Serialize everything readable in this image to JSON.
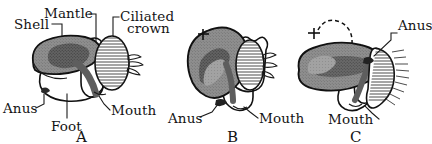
{
  "figure": {
    "background_color": "#ffffff",
    "ink_color": "#111111",
    "shell_fill": "#8e8e8e",
    "shell_dark_fill": "#4f4f4f",
    "visceral_fill": "#a8a8a8",
    "body_fill": "#ffffff"
  },
  "panels": [
    {
      "id": "A",
      "letter": "A",
      "labels": [
        {
          "key": "shell",
          "text": "Shell"
        },
        {
          "key": "mantle",
          "text": "Mantle"
        },
        {
          "key": "ciliated_crown",
          "text": "Ciliated"
        },
        {
          "key": "ciliated_crown2",
          "text": "crown"
        },
        {
          "key": "anus",
          "text": "Anus"
        },
        {
          "key": "foot",
          "text": "Foot"
        },
        {
          "key": "mouth",
          "text": "Mouth"
        }
      ]
    },
    {
      "id": "B",
      "letter": "B",
      "labels": [
        {
          "key": "anus",
          "text": "Anus"
        },
        {
          "key": "mouth",
          "text": "Mouth"
        }
      ],
      "markers": [
        {
          "key": "plus-1",
          "symbol": "+"
        }
      ]
    },
    {
      "id": "C",
      "letter": "C",
      "labels": [
        {
          "key": "anus",
          "text": "Anus"
        },
        {
          "key": "mouth",
          "text": "Mouth"
        }
      ],
      "markers": [
        {
          "key": "plus-1",
          "symbol": "+"
        },
        {
          "key": "plus-2",
          "symbol": "+"
        }
      ],
      "annotations": [
        {
          "key": "torsion-arrow",
          "text": ""
        }
      ]
    }
  ]
}
